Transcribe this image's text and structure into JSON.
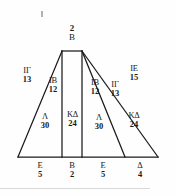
{
  "figure": {
    "type": "geometric-diagram",
    "apex": {
      "number": "2",
      "letter": "B"
    },
    "inner_labels": [
      {
        "id": "left-outer",
        "letter": "ΙΓ",
        "number": "13"
      },
      {
        "id": "left-inner",
        "letter": "ΙΒ",
        "number": "12"
      },
      {
        "id": "right-inner",
        "letter": "ΙΒ",
        "number": "12"
      },
      {
        "id": "right-mid",
        "letter": "ΙΓ",
        "number": "13"
      },
      {
        "id": "right-outer",
        "letter": "ΙΕ",
        "number": "15"
      }
    ],
    "area_labels": [
      {
        "id": "area-left",
        "letter": "Λ",
        "number": "30"
      },
      {
        "id": "area-center",
        "letter": "ΚΔ",
        "number": "24"
      },
      {
        "id": "area-right",
        "letter": "Λ",
        "number": "30"
      },
      {
        "id": "area-right-outer",
        "letter": "ΚΔ",
        "number": "24"
      }
    ],
    "base_labels": [
      {
        "id": "base-1",
        "letter": "Ε",
        "number": "5"
      },
      {
        "id": "base-2",
        "letter": "Β",
        "number": "2"
      },
      {
        "id": "base-3",
        "letter": "Ε",
        "number": "5"
      },
      {
        "id": "base-4",
        "letter": "Δ",
        "number": "4"
      }
    ],
    "colors": {
      "stroke": "#1a1a1a",
      "background": "#fefefe",
      "text": "#1a1a1a",
      "rule": "#d9d9d9"
    },
    "geometry": {
      "apex_left_x": 62,
      "apex_right_x": 82,
      "apex_y": 51,
      "base_y": 157,
      "base_left_x": 18,
      "base_right_x": 158,
      "divider_xs": [
        62,
        82,
        125
      ]
    }
  }
}
